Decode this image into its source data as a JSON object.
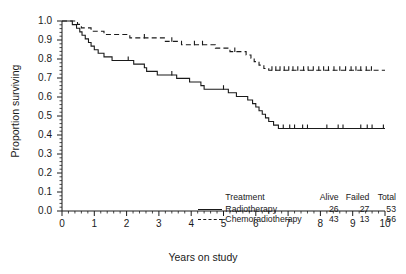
{
  "chart_data": {
    "type": "line",
    "title": "",
    "subtitle": "",
    "xlabel": "Years on study",
    "ylabel": "Proportion surviving",
    "xlim": [
      0,
      10
    ],
    "ylim": [
      0,
      1
    ],
    "xticks": [
      0,
      1,
      2,
      3,
      4,
      5,
      6,
      7,
      8,
      9,
      10
    ],
    "xtick_labels": [
      "0",
      "1",
      "2",
      "3",
      "4",
      "5",
      "6",
      "7",
      "8",
      "9",
      "10"
    ],
    "yticks": [
      0.0,
      0.1,
      0.2,
      0.3,
      0.4,
      0.5,
      0.6,
      0.7,
      0.8,
      0.9,
      1.0
    ],
    "ytick_labels": [
      "0.0",
      "0.1",
      "0.2",
      "0.3",
      "0.4",
      "0.5",
      "0.6",
      "0.7",
      "0.8",
      "0.9",
      "1.0"
    ],
    "grid": false,
    "legend_position": "lower-right",
    "minor_ticks": true,
    "series": [
      {
        "name": "Radiotherapy",
        "style": "solid",
        "color": "#1a1a1a",
        "steps": [
          [
            0.0,
            1.0
          ],
          [
            0.25,
            1.0
          ],
          [
            0.32,
            0.981
          ],
          [
            0.45,
            0.962
          ],
          [
            0.55,
            0.943
          ],
          [
            0.62,
            0.925
          ],
          [
            0.72,
            0.906
          ],
          [
            0.82,
            0.887
          ],
          [
            0.9,
            0.868
          ],
          [
            1.0,
            0.849
          ],
          [
            1.12,
            0.83
          ],
          [
            1.3,
            0.811
          ],
          [
            1.55,
            0.792
          ],
          [
            2.1,
            0.792
          ],
          [
            2.22,
            0.773
          ],
          [
            2.55,
            0.754
          ],
          [
            2.62,
            0.735
          ],
          [
            2.95,
            0.716
          ],
          [
            3.45,
            0.716
          ],
          [
            3.55,
            0.698
          ],
          [
            3.95,
            0.679
          ],
          [
            4.3,
            0.66
          ],
          [
            4.4,
            0.641
          ],
          [
            5.05,
            0.641
          ],
          [
            5.15,
            0.622
          ],
          [
            5.4,
            0.603
          ],
          [
            5.75,
            0.584
          ],
          [
            5.9,
            0.565
          ],
          [
            6.0,
            0.547
          ],
          [
            6.1,
            0.528
          ],
          [
            6.2,
            0.509
          ],
          [
            6.3,
            0.49
          ],
          [
            6.4,
            0.471
          ],
          [
            6.55,
            0.452
          ],
          [
            6.7,
            0.434
          ],
          [
            10.0,
            0.434
          ]
        ],
        "censored": [
          [
            2.05,
            0.792
          ],
          [
            3.4,
            0.716
          ],
          [
            5.0,
            0.641
          ],
          [
            6.85,
            0.434
          ],
          [
            7.05,
            0.434
          ],
          [
            7.2,
            0.434
          ],
          [
            7.45,
            0.434
          ],
          [
            7.6,
            0.434
          ],
          [
            8.2,
            0.434
          ],
          [
            8.55,
            0.434
          ],
          [
            8.7,
            0.434
          ],
          [
            9.25,
            0.434
          ],
          [
            9.45,
            0.434
          ],
          [
            9.6,
            0.434
          ],
          [
            9.95,
            0.434
          ]
        ]
      },
      {
        "name": "Chemoradiotherapy",
        "style": "dashed",
        "color": "#1a1a1a",
        "steps": [
          [
            0.0,
            1.0
          ],
          [
            0.38,
            1.0
          ],
          [
            0.48,
            0.982
          ],
          [
            0.6,
            0.964
          ],
          [
            0.78,
            0.964
          ],
          [
            0.9,
            0.946
          ],
          [
            1.15,
            0.946
          ],
          [
            1.3,
            0.929
          ],
          [
            1.95,
            0.929
          ],
          [
            2.1,
            0.911
          ],
          [
            3.05,
            0.911
          ],
          [
            3.2,
            0.893
          ],
          [
            3.55,
            0.893
          ],
          [
            3.7,
            0.875
          ],
          [
            4.6,
            0.875
          ],
          [
            4.75,
            0.857
          ],
          [
            5.05,
            0.857
          ],
          [
            5.2,
            0.839
          ],
          [
            5.55,
            0.839
          ],
          [
            5.7,
            0.821
          ],
          [
            5.85,
            0.804
          ],
          [
            5.95,
            0.786
          ],
          [
            6.1,
            0.768
          ],
          [
            6.25,
            0.75
          ],
          [
            6.4,
            0.741
          ],
          [
            10.0,
            0.741
          ]
        ],
        "censored": [
          [
            2.55,
            0.911
          ],
          [
            3.4,
            0.893
          ],
          [
            4.1,
            0.875
          ],
          [
            4.35,
            0.875
          ],
          [
            5.35,
            0.839
          ],
          [
            6.5,
            0.741
          ],
          [
            6.62,
            0.741
          ],
          [
            6.75,
            0.741
          ],
          [
            6.88,
            0.741
          ],
          [
            7.02,
            0.741
          ],
          [
            7.15,
            0.741
          ],
          [
            7.3,
            0.741
          ],
          [
            7.48,
            0.741
          ],
          [
            7.62,
            0.741
          ],
          [
            7.78,
            0.741
          ],
          [
            7.95,
            0.741
          ],
          [
            8.1,
            0.741
          ],
          [
            8.25,
            0.741
          ],
          [
            8.42,
            0.741
          ],
          [
            8.6,
            0.741
          ],
          [
            8.78,
            0.741
          ],
          [
            8.95,
            0.741
          ],
          [
            9.1,
            0.741
          ],
          [
            9.25,
            0.741
          ],
          [
            9.42,
            0.741
          ],
          [
            9.58,
            0.741
          ]
        ]
      }
    ]
  },
  "legend": {
    "header": {
      "treatment": "Treatment",
      "alive": "Alive",
      "failed": "Failed",
      "total": "Total"
    },
    "rows": [
      {
        "name": "Radiotherapy",
        "style": "solid",
        "alive": "26",
        "failed": "27",
        "total": "53"
      },
      {
        "name": "Chemoradiotherapy",
        "style": "dashed",
        "alive": "43",
        "failed": "13",
        "total": "56"
      }
    ]
  }
}
